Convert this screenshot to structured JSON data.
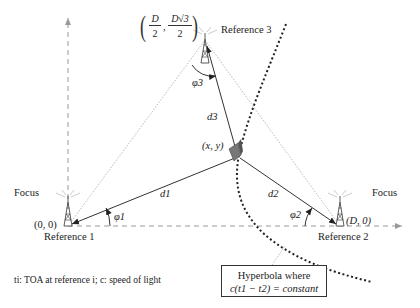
{
  "diagram": {
    "type": "TDOA hyperbolic positioning geometry",
    "references": [
      {
        "name": "Reference 1",
        "coord": "(0, 0)",
        "focus_label": "Focus"
      },
      {
        "name": "Reference 2",
        "coord": "(D, 0)",
        "focus_label": "Focus"
      },
      {
        "name": "Reference 3",
        "coord_num1": "D",
        "coord_den1": "2",
        "coord_num2": "D√3",
        "coord_den2": "2"
      }
    ],
    "mobile": {
      "label": "(x, y)"
    },
    "distances": [
      "d1",
      "d2",
      "d3"
    ],
    "angles": [
      "φ1",
      "φ2",
      "φ3"
    ],
    "hyperbola_box": {
      "line1": "Hyperbola where",
      "line2": "c(t1 − t2) = constant"
    },
    "footnote": "ti: TOA at reference i; c: speed of light"
  },
  "colors": {
    "line": "#333333",
    "dotted_light": "#bbbbbb",
    "axis": "#999999",
    "hyperbola": "#222222"
  }
}
